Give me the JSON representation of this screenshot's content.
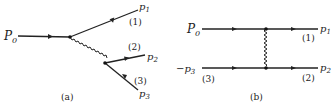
{
  "diagram_a": {
    "caption": "(a)",
    "incoming": {
      "label": "P",
      "sub": "0"
    },
    "outgoing": [
      {
        "label": "p",
        "sub": "1",
        "index": "(1)"
      },
      {
        "label": "p",
        "sub": "2",
        "index": "(2)"
      },
      {
        "label": "p",
        "sub": "3",
        "index": "(3)"
      }
    ],
    "propagator": "wavy"
  },
  "diagram_b": {
    "caption": "(b)",
    "top_in": {
      "label": "P",
      "sub": "0"
    },
    "bottom_in": {
      "label": "−p",
      "sub": "3",
      "index": "(3)"
    },
    "top_out": {
      "label": "p",
      "sub": "1",
      "index": "(1)"
    },
    "bottom_out": {
      "label": "p",
      "sub": "2",
      "index": "(2)"
    },
    "propagator": "wavy"
  }
}
